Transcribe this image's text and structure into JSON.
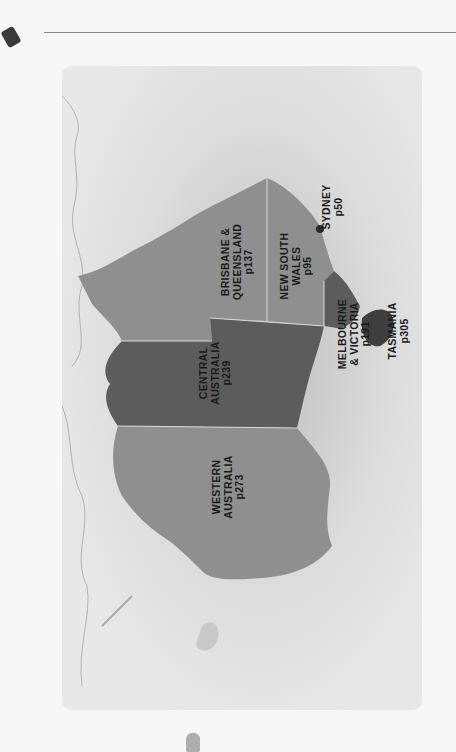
{
  "map": {
    "title": "Australia regions map",
    "orientation": "rotated 90° (north to the right)",
    "colors": {
      "background": "#e6e6e6",
      "sea_fade": "#f2f2f2",
      "region_light": "#8f8f8f",
      "region_dark": "#5c5c5c",
      "border": "#d9d9d9",
      "text": "#1a1a1a"
    },
    "regions": [
      {
        "id": "brisbane-queensland",
        "lines": [
          "BRISBANE &",
          "QUEENSLAND",
          "p137"
        ],
        "shade": "light"
      },
      {
        "id": "new-south-wales",
        "lines": [
          "NEW SOUTH",
          "WALES",
          "p95"
        ],
        "shade": "light"
      },
      {
        "id": "sydney",
        "lines": [
          "SYDNEY",
          "p50"
        ],
        "shade": "point"
      },
      {
        "id": "melbourne-victoria",
        "lines": [
          "MELBOURNE",
          "& VICTORIA",
          "p191"
        ],
        "shade": "dark"
      },
      {
        "id": "tasmania",
        "lines": [
          "TASMANIA",
          "p305"
        ],
        "shade": "dark"
      },
      {
        "id": "central-australia",
        "lines": [
          "CENTRAL",
          "AUSTRALIA",
          "p239"
        ],
        "shade": "dark"
      },
      {
        "id": "western-australia",
        "lines": [
          "WESTERN",
          "AUSTRALIA",
          "p273"
        ],
        "shade": "light"
      }
    ]
  }
}
